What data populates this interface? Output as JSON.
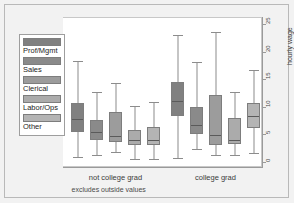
{
  "chart_data": {
    "type": "box",
    "title": "",
    "xlabel": "",
    "ylabel": "hourly wage",
    "note": "excludes outside values",
    "ylim": [
      0,
      25
    ],
    "yticks": [
      0,
      5,
      10,
      15,
      20,
      25
    ],
    "grid": false,
    "legend_position": "left-outside",
    "groups": [
      "not college grad",
      "college grad"
    ],
    "categories": [
      "Prof/Mgmt",
      "Sales",
      "Clerical",
      "Labor/Ops",
      "Other"
    ],
    "colors": {
      "Prof/Mgmt": "#808080",
      "Sales": "#8a8a8a",
      "Clerical": "#9c9c9c",
      "Labor/Ops": "#ababab",
      "Other": "#b4b4b4"
    },
    "series": [
      {
        "group": "not college grad",
        "boxes": [
          {
            "category": "Prof/Mgmt",
            "lower_whisker": 1.3,
            "q1": 5.8,
            "median": 8.3,
            "q3": 11.1,
            "upper_whisker": 18.7
          },
          {
            "category": "Sales",
            "lower_whisker": 1.6,
            "q1": 4.3,
            "median": 5.9,
            "q3": 8.0,
            "upper_whisker": 13.1
          },
          {
            "category": "Clerical",
            "lower_whisker": 2.2,
            "q1": 3.9,
            "median": 5.2,
            "q3": 9.5,
            "upper_whisker": 14.6
          },
          {
            "category": "Labor/Ops",
            "lower_whisker": 0.9,
            "q1": 3.5,
            "median": 4.6,
            "q3": 6.2,
            "upper_whisker": 10.5
          },
          {
            "category": "Other",
            "lower_whisker": 0.9,
            "q1": 3.5,
            "median": 4.6,
            "q3": 6.7,
            "upper_whisker": 11.2
          }
        ]
      },
      {
        "group": "college grad",
        "boxes": [
          {
            "category": "Prof/Mgmt",
            "lower_whisker": 1.1,
            "q1": 8.7,
            "median": 11.6,
            "q3": 14.9,
            "upper_whisker": 23.3
          },
          {
            "category": "Sales",
            "lower_whisker": 2.7,
            "q1": 5.5,
            "median": 7.3,
            "q3": 10.3,
            "upper_whisker": 18.5
          },
          {
            "category": "Clerical",
            "lower_whisker": 1.6,
            "q1": 3.4,
            "median": 5.5,
            "q3": 12.5,
            "upper_whisker": 23.9
          },
          {
            "category": "Labor/Ops",
            "lower_whisker": 1.6,
            "q1": 3.6,
            "median": 4.6,
            "q3": 8.3,
            "upper_whisker": 13.1
          },
          {
            "category": "Other",
            "lower_whisker": 2.0,
            "q1": 6.6,
            "median": 8.8,
            "q3": 11.1,
            "upper_whisker": 17.0
          }
        ]
      }
    ]
  },
  "axis": {
    "y_title": "hourly wage",
    "y_tick_labels": [
      "0",
      "5",
      "10",
      "15",
      "20",
      "25"
    ],
    "x_group_labels": [
      "not college grad",
      "college grad"
    ],
    "footnote": "excludes outside values"
  },
  "legend": {
    "items": [
      {
        "label": "Prof/Mgmt",
        "color": "#808080"
      },
      {
        "label": "Sales",
        "color": "#8a8a8a"
      },
      {
        "label": "Clerical",
        "color": "#9c9c9c"
      },
      {
        "label": "Labor/Ops",
        "color": "#ababab"
      },
      {
        "label": "Other",
        "color": "#b4b4b4"
      }
    ]
  }
}
